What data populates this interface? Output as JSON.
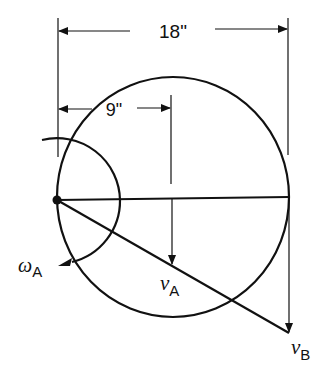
{
  "diagram": {
    "type": "kinematics-wheel",
    "colors": {
      "ink": "#111111",
      "background": "#ffffff"
    },
    "dimensions": {
      "overall": {
        "label": "18\""
      },
      "half": {
        "label": "9\""
      }
    },
    "labels": {
      "omega": {
        "symbol": "ω",
        "subscript": "A"
      },
      "vA": {
        "symbol": "v",
        "subscript": "A"
      },
      "vB": {
        "symbol": "v",
        "subscript": "B"
      }
    },
    "elements": [
      "circle (wheel, diameter 18\")",
      "pivot point at left edge of circle",
      "horizontal diameter line",
      "angular velocity arc ω_A with arrow",
      "velocity vector v_A at center",
      "velocity vector v_B at right edge",
      "line from pivot through v_A tip to v_B tip"
    ]
  }
}
